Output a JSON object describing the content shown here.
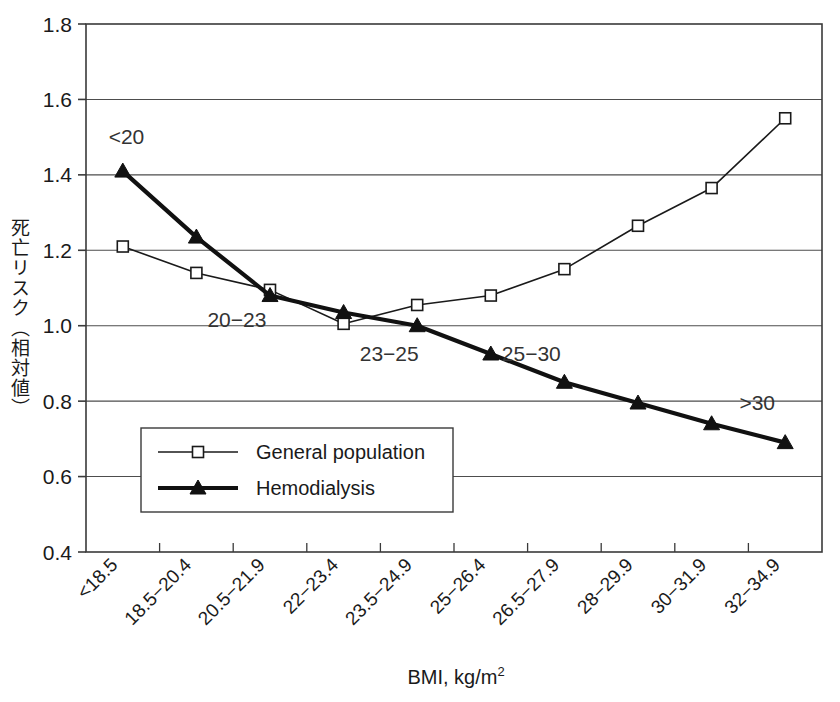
{
  "chart_data": {
    "type": "line",
    "title": "",
    "xlabel": "BMI,  kg/m2",
    "xlabel_base": "BMI,  kg/m",
    "xlabel_sup": "2",
    "ylabel": "死亡リスク（相対値）",
    "ylim": [
      0.4,
      1.8
    ],
    "ytick_step": 0.2,
    "grid": "horizontal",
    "legend_position": "inside-lower-left",
    "categories": [
      "<18.5",
      "18.5−20.4",
      "20.5−21.9",
      "22−23.4",
      "23.5−24.9",
      "25−26.4",
      "26.5−27.9",
      "28−29.9",
      "30−31.9",
      "32−34.9"
    ],
    "yticks": [
      "0.4",
      "0.6",
      "0.8",
      "1.0",
      "1.2",
      "1.4",
      "1.6",
      "1.8"
    ],
    "ytick_values": [
      0.4,
      0.6,
      0.8,
      1.0,
      1.2,
      1.4,
      1.6,
      1.8
    ],
    "series": [
      {
        "name": "General population",
        "marker": "open-square",
        "line_width": 1.6,
        "color": "#1a1a1a",
        "values": [
          1.21,
          1.14,
          1.095,
          1.005,
          1.055,
          1.08,
          1.15,
          1.265,
          1.365,
          1.55
        ]
      },
      {
        "name": "Hemodialysis",
        "marker": "filled-triangle",
        "line_width": 4.2,
        "color": "#111111",
        "values": [
          1.41,
          1.235,
          1.08,
          1.035,
          1.0,
          0.925,
          0.85,
          0.795,
          0.74,
          0.69
        ]
      }
    ],
    "annotations": [
      {
        "text": "<20",
        "x_index": 0.05,
        "y": 1.5
      },
      {
        "text": "20−23",
        "x_index": 1.55,
        "y": 1.015
      },
      {
        "text": "23−25",
        "x_index": 3.62,
        "y": 0.925
      },
      {
        "text": "25−30",
        "x_index": 5.55,
        "y": 0.925
      },
      {
        "text": ">30",
        "x_index": 8.62,
        "y": 0.795
      }
    ]
  },
  "legend": {
    "entries": [
      {
        "label": "General population",
        "marker": "open-square"
      },
      {
        "label": "Hemodialysis",
        "marker": "filled-triangle"
      }
    ]
  }
}
